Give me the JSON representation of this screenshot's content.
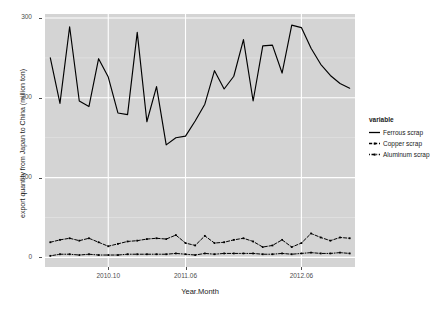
{
  "chart_data": {
    "type": "line",
    "title": "",
    "xlabel": "Year.Month",
    "ylabel": "export quantity from Japan to China (million ton)",
    "ylim": [
      -12,
      305
    ],
    "yticks": [
      0,
      100,
      200,
      300
    ],
    "ytick_labels": [
      "0",
      "100",
      "200",
      "300"
    ],
    "xticks": [
      "2010.10",
      "2011.06",
      "2012.06"
    ],
    "xtick_positions": [
      6,
      14,
      26
    ],
    "grid": true,
    "grid_color": "#ffffff",
    "panel_background": "#d4d4d4",
    "legend_position": "right",
    "legend_title": "variable",
    "x": [
      "2010.04",
      "2010.05",
      "2010.06",
      "2010.07",
      "2010.08",
      "2010.09",
      "2010.10",
      "2010.11",
      "2010.12",
      "2011.01",
      "2011.02",
      "2011.03",
      "2011.04",
      "2011.05",
      "2011.06",
      "2011.07",
      "2011.08",
      "2011.09",
      "2011.10",
      "2011.11",
      "2011.12",
      "2012.01",
      "2012.02",
      "2012.03",
      "2012.04",
      "2012.05",
      "2012.06",
      "2012.07",
      "2012.08",
      "2012.09",
      "2012.10",
      "2012.11"
    ],
    "series": [
      {
        "name": "Ferrous scrap",
        "color": "#000000",
        "linetype": "solid",
        "values": [
          250,
          193,
          289,
          196,
          189,
          249,
          226,
          181,
          179,
          282,
          170,
          214,
          141,
          150,
          152,
          171,
          192,
          234,
          211,
          227,
          273,
          196,
          265,
          266,
          231,
          291,
          288,
          262,
          242,
          228,
          218,
          212
        ]
      },
      {
        "name": "Copper scrap",
        "color": "#000000",
        "linetype": "dashed",
        "values": [
          19,
          22,
          24,
          21,
          24,
          19,
          14,
          17,
          20,
          21,
          23,
          24,
          23,
          28,
          18,
          15,
          27,
          18,
          19,
          22,
          24,
          20,
          13,
          15,
          22,
          13,
          18,
          30,
          25,
          21,
          25,
          24
        ]
      },
      {
        "name": "Aluminum scrap",
        "color": "#000000",
        "linetype": "dotdash",
        "values": [
          2,
          4,
          4,
          3,
          4,
          3,
          3,
          3,
          4,
          4,
          4,
          4,
          4,
          5,
          4,
          3,
          5,
          4,
          5,
          5,
          5,
          5,
          4,
          4,
          5,
          4,
          5,
          6,
          5,
          5,
          6,
          5
        ]
      }
    ]
  }
}
